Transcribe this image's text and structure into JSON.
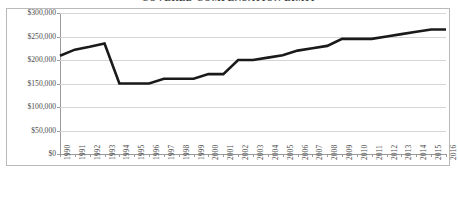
{
  "chart_data": {
    "type": "line",
    "title": "COVERED COMPENSATION LIMIT",
    "xlabel": "",
    "ylabel": "",
    "ylim": [
      0,
      300000
    ],
    "ytick_labels": [
      "$0",
      "$50,000",
      "$100,000",
      "$150,000",
      "$200,000",
      "$250,000",
      "$300,000"
    ],
    "ytick_values": [
      0,
      50000,
      100000,
      150000,
      200000,
      250000,
      300000
    ],
    "grid": true,
    "legend": "none",
    "series_color": "#1a1a1a",
    "grid_color": "#d6d6d6",
    "axis_color": "#9a9a9a",
    "border_color": "#b9b9b9",
    "background": "#ffffff",
    "categories": [
      "1990",
      "1991",
      "1992",
      "1993",
      "1994",
      "1995",
      "1996",
      "1997",
      "1998",
      "1999",
      "2000",
      "2001",
      "2002",
      "2003",
      "2004",
      "2005",
      "2006",
      "2007",
      "2008",
      "2009",
      "2010",
      "2011",
      "2012",
      "2013",
      "2014",
      "2015",
      "2016"
    ],
    "series": [
      {
        "name": "Covered Compensation Limit",
        "values": [
          209000,
          222000,
          228000,
          235000,
          150000,
          150000,
          150000,
          160000,
          160000,
          160000,
          170000,
          170000,
          200000,
          200000,
          205000,
          210000,
          220000,
          225000,
          230000,
          245000,
          245000,
          245000,
          250000,
          255000,
          260000,
          265000,
          265000
        ]
      }
    ]
  }
}
